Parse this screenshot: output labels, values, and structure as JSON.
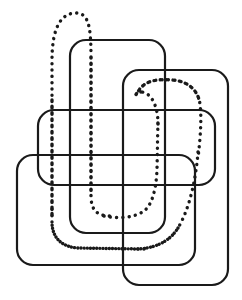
{
  "figure": {
    "background_color": "#ffffff",
    "canvas": {
      "width": 242,
      "height": 300
    },
    "solid": {
      "stroke_color": "#1a1a1a",
      "stroke_width": 2.2,
      "corner_radius": 16,
      "count": 4,
      "shapes": [
        {
          "name": "rect-top-left",
          "x": 70,
          "y": 40,
          "width": 95,
          "height": 193,
          "rx": 16
        },
        {
          "name": "rect-top-right",
          "x": 123,
          "y": 70,
          "width": 105,
          "height": 215,
          "rx": 16
        },
        {
          "name": "rect-middle-wide",
          "x": 38,
          "y": 110,
          "width": 177,
          "height": 75,
          "rx": 16
        },
        {
          "name": "rect-bottom-left",
          "x": 17,
          "y": 155,
          "width": 178,
          "height": 110,
          "rx": 16
        }
      ]
    },
    "dotted": {
      "stroke_color": "#1a1a1a",
      "stroke_width": 3.4,
      "dash_pattern": "0.1 6.2",
      "strand_count": 1,
      "path_note": "single continuous closed loop winding through all four rectangles",
      "key_points": {
        "left_peak": [
          75,
          14
        ],
        "left_branch_x": 52,
        "right_branch_x": 90,
        "upper_loop_peak": [
          168,
          82
        ],
        "upper_loop_left_x": 140,
        "upper_loop_right_x": 199,
        "inner_u_bottom_y": 216,
        "outer_sweep_y": 248
      }
    }
  }
}
